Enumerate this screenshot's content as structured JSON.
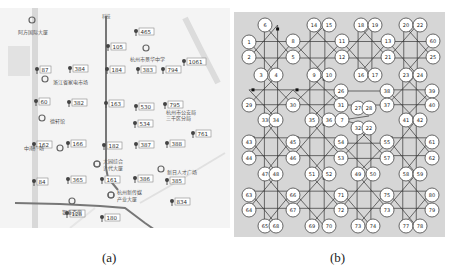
{
  "captions": {
    "a": "(a)",
    "b": "(b)"
  },
  "map": {
    "roads": [
      {
        "name": "vertical-road-left",
        "pts": [
          [
            35,
            0
          ],
          [
            35,
            220
          ]
        ],
        "w": 6,
        "c": "#d8d8d8"
      },
      {
        "name": "vertical-road-center",
        "pts": [
          [
            106,
            8
          ],
          [
            106,
            160
          ],
          [
            108,
            170
          ],
          [
            118,
            182
          ]
        ],
        "w": 2,
        "c": "#777"
      },
      {
        "name": "horizontal-road-bottom",
        "pts": [
          [
            15,
            195
          ],
          [
            60,
            196
          ],
          [
            100,
            198
          ],
          [
            125,
            200
          ],
          [
            145,
            215
          ],
          [
            155,
            222
          ]
        ],
        "w": 2,
        "c": "#777"
      },
      {
        "name": "diagonal-road-right",
        "pts": [
          [
            185,
            10
          ],
          [
            200,
            40
          ],
          [
            218,
            75
          ]
        ],
        "w": 6,
        "c": "#dcdcdc"
      },
      {
        "name": "diagonal-road-lower",
        "pts": [
          [
            140,
            195
          ],
          [
            175,
            175
          ],
          [
            225,
            145
          ]
        ],
        "w": 2,
        "c": "#e0e0e0"
      },
      {
        "name": "diagonal-road-lower2",
        "pts": [
          [
            70,
            220
          ],
          [
            95,
            200
          ]
        ],
        "w": 2,
        "c": "#e6e6e6"
      }
    ],
    "markers": [
      {
        "x": 136,
        "y": 23,
        "label": "465"
      },
      {
        "x": 108,
        "y": 38,
        "label": "105"
      },
      {
        "x": 184,
        "y": 53,
        "label": "1061"
      },
      {
        "x": 37,
        "y": 61,
        "label": "87"
      },
      {
        "x": 70,
        "y": 60,
        "label": "384"
      },
      {
        "x": 107,
        "y": 61,
        "label": "184"
      },
      {
        "x": 138,
        "y": 61,
        "label": "383"
      },
      {
        "x": 163,
        "y": 61,
        "label": "794"
      },
      {
        "x": 36,
        "y": 93,
        "label": "60"
      },
      {
        "x": 69,
        "y": 94,
        "label": "382"
      },
      {
        "x": 106,
        "y": 95,
        "label": "163"
      },
      {
        "x": 136,
        "y": 98,
        "label": "530"
      },
      {
        "x": 165,
        "y": 96,
        "label": "795"
      },
      {
        "x": 135,
        "y": 115,
        "label": "534"
      },
      {
        "x": 193,
        "y": 125,
        "label": "761"
      },
      {
        "x": 34,
        "y": 136,
        "label": "162"
      },
      {
        "x": 68,
        "y": 135,
        "label": "166"
      },
      {
        "x": 104,
        "y": 137,
        "label": "182"
      },
      {
        "x": 136,
        "y": 136,
        "label": "387"
      },
      {
        "x": 167,
        "y": 135,
        "label": "388"
      },
      {
        "x": 34,
        "y": 173,
        "label": "84"
      },
      {
        "x": 68,
        "y": 171,
        "label": "365"
      },
      {
        "x": 102,
        "y": 171,
        "label": "161"
      },
      {
        "x": 135,
        "y": 170,
        "label": "386"
      },
      {
        "x": 167,
        "y": 172,
        "label": "385"
      },
      {
        "x": 172,
        "y": 193,
        "label": "834"
      },
      {
        "x": 67,
        "y": 205,
        "label": "128"
      },
      {
        "x": 102,
        "y": 209,
        "label": "180"
      }
    ],
    "pois": [
      {
        "x": 32,
        "y": 12,
        "label": "阿方国际大厦",
        "dx": -14,
        "dy": 12
      },
      {
        "x": 45,
        "y": 71,
        "label": "浙江省家电市场",
        "dx": 8,
        "dy": 3
      },
      {
        "x": 146,
        "y": 40,
        "label": "杭州市景华中学",
        "dx": -16,
        "dy": 11
      },
      {
        "x": 42,
        "y": 110,
        "label": "德轩馆",
        "dx": 8,
        "dy": 3
      },
      {
        "x": 166,
        "y": 104,
        "label": "杭州市公安局",
        "dx": 0,
        "dy": 0
      },
      {
        "x": 166,
        "y": 110,
        "label": "三千区分局",
        "dx": 0,
        "dy": 0
      },
      {
        "x": 97,
        "y": 156,
        "label": "大园综合",
        "dx": 6,
        "dy": -3
      },
      {
        "x": 97,
        "y": 156,
        "label": "计代大厦",
        "dx": 6,
        "dy": 4
      },
      {
        "x": 161,
        "y": 161,
        "label": "新日人才广场",
        "dx": 6,
        "dy": 3
      },
      {
        "x": 111,
        "y": 187,
        "label": "杭州新传媒",
        "dx": 6,
        "dy": -3
      },
      {
        "x": 111,
        "y": 187,
        "label": "产业大厦",
        "dx": 6,
        "dy": 4
      },
      {
        "x": 72,
        "y": 193,
        "label": "银泰百货",
        "dx": -10,
        "dy": 11
      },
      {
        "x": 60,
        "y": 140,
        "label": "中南广场",
        "dx": -36,
        "dy": 0
      }
    ],
    "road_labels": [
      {
        "x": 106,
        "y": 10,
        "label": "科技"
      },
      {
        "x": 198,
        "y": 228,
        "label": "汉德路"
      },
      {
        "x": 60,
        "y": 225,
        "label": "汉德广场"
      }
    ]
  },
  "graph": {
    "node_radius": 7,
    "nodes": [
      {
        "id": "1",
        "x": 15,
        "y": 30
      },
      {
        "id": "2",
        "x": 15,
        "y": 45
      },
      {
        "id": "6",
        "x": 31,
        "y": 13
      },
      {
        "id": "8",
        "x": 59,
        "y": 29
      },
      {
        "id": "5",
        "x": 59,
        "y": 45
      },
      {
        "id": "3",
        "x": 27,
        "y": 63
      },
      {
        "id": "4",
        "x": 42,
        "y": 63
      },
      {
        "id": "14",
        "x": 80,
        "y": 13
      },
      {
        "id": "15",
        "x": 95,
        "y": 13
      },
      {
        "id": "9",
        "x": 80,
        "y": 63
      },
      {
        "id": "10",
        "x": 95,
        "y": 63
      },
      {
        "id": "11",
        "x": 108,
        "y": 29
      },
      {
        "id": "12",
        "x": 108,
        "y": 45
      },
      {
        "id": "18",
        "x": 127,
        "y": 13
      },
      {
        "id": "19",
        "x": 141,
        "y": 13
      },
      {
        "id": "16",
        "x": 127,
        "y": 63
      },
      {
        "id": "17",
        "x": 141,
        "y": 63
      },
      {
        "id": "13",
        "x": 154,
        "y": 29
      },
      {
        "id": "21",
        "x": 154,
        "y": 45
      },
      {
        "id": "20",
        "x": 172,
        "y": 13
      },
      {
        "id": "22",
        "x": 186,
        "y": 13
      },
      {
        "id": "23",
        "x": 172,
        "y": 63
      },
      {
        "id": "24",
        "x": 186,
        "y": 63
      },
      {
        "id": "60",
        "x": 199,
        "y": 29
      },
      {
        "id": "25",
        "x": 199,
        "y": 45
      },
      {
        "id": "29",
        "x": 15,
        "y": 93
      },
      {
        "id": "30",
        "x": 59,
        "y": 93
      },
      {
        "id": "26",
        "x": 107,
        "y": 79
      },
      {
        "id": "31",
        "x": 107,
        "y": 93
      },
      {
        "id": "33",
        "x": 31,
        "y": 108
      },
      {
        "id": "34",
        "x": 42,
        "y": 108
      },
      {
        "id": "35",
        "x": 78,
        "y": 108
      },
      {
        "id": "36",
        "x": 95,
        "y": 108
      },
      {
        "id": "7",
        "x": 108,
        "y": 108
      },
      {
        "id": "27",
        "x": 124,
        "y": 96
      },
      {
        "id": "28",
        "x": 135,
        "y": 96
      },
      {
        "id": "32",
        "x": 124,
        "y": 116
      },
      {
        "id": "22b",
        "x": 135,
        "y": 116
      },
      {
        "id": "38",
        "x": 153,
        "y": 79
      },
      {
        "id": "39",
        "x": 198,
        "y": 79
      },
      {
        "id": "37",
        "x": 153,
        "y": 93
      },
      {
        "id": "40",
        "x": 198,
        "y": 93
      },
      {
        "id": "41",
        "x": 172,
        "y": 108
      },
      {
        "id": "42",
        "x": 186,
        "y": 108
      },
      {
        "id": "43",
        "x": 15,
        "y": 130
      },
      {
        "id": "44",
        "x": 15,
        "y": 146
      },
      {
        "id": "45",
        "x": 59,
        "y": 130
      },
      {
        "id": "46",
        "x": 59,
        "y": 146
      },
      {
        "id": "54",
        "x": 107,
        "y": 130
      },
      {
        "id": "53",
        "x": 107,
        "y": 146
      },
      {
        "id": "55",
        "x": 153,
        "y": 130
      },
      {
        "id": "57",
        "x": 153,
        "y": 146
      },
      {
        "id": "61",
        "x": 198,
        "y": 130
      },
      {
        "id": "62",
        "x": 198,
        "y": 146
      },
      {
        "id": "47",
        "x": 31,
        "y": 162
      },
      {
        "id": "48",
        "x": 42,
        "y": 162
      },
      {
        "id": "51",
        "x": 78,
        "y": 162
      },
      {
        "id": "52",
        "x": 95,
        "y": 162
      },
      {
        "id": "49",
        "x": 124,
        "y": 162
      },
      {
        "id": "50",
        "x": 139,
        "y": 162
      },
      {
        "id": "58",
        "x": 172,
        "y": 162
      },
      {
        "id": "59",
        "x": 186,
        "y": 162
      },
      {
        "id": "63",
        "x": 15,
        "y": 183
      },
      {
        "id": "64",
        "x": 15,
        "y": 198
      },
      {
        "id": "66",
        "x": 59,
        "y": 183
      },
      {
        "id": "67",
        "x": 59,
        "y": 198
      },
      {
        "id": "71",
        "x": 107,
        "y": 183
      },
      {
        "id": "72",
        "x": 107,
        "y": 198
      },
      {
        "id": "75",
        "x": 153,
        "y": 183
      },
      {
        "id": "73",
        "x": 153,
        "y": 198
      },
      {
        "id": "80",
        "x": 198,
        "y": 183
      },
      {
        "id": "79",
        "x": 198,
        "y": 198
      },
      {
        "id": "65",
        "x": 31,
        "y": 214
      },
      {
        "id": "68",
        "x": 42,
        "y": 214
      },
      {
        "id": "69",
        "x": 78,
        "y": 214
      },
      {
        "id": "70",
        "x": 95,
        "y": 214
      },
      {
        "id": "73b",
        "x": 124,
        "y": 214
      },
      {
        "id": "74",
        "x": 139,
        "y": 214
      },
      {
        "id": "77",
        "x": 172,
        "y": 214
      },
      {
        "id": "78",
        "x": 186,
        "y": 214
      }
    ],
    "cluster_frames": [
      {
        "x0": 15,
        "y0": 13,
        "x1": 59,
        "y1": 63
      },
      {
        "x0": 59,
        "y0": 13,
        "x1": 108,
        "y1": 63
      },
      {
        "x0": 108,
        "y0": 13,
        "x1": 154,
        "y1": 63
      },
      {
        "x0": 154,
        "y0": 13,
        "x1": 199,
        "y1": 63
      },
      {
        "x0": 15,
        "y0": 63,
        "x1": 59,
        "y1": 108
      },
      {
        "x0": 59,
        "y0": 63,
        "x1": 107,
        "y1": 108
      },
      {
        "x0": 153,
        "y0": 63,
        "x1": 198,
        "y1": 108
      },
      {
        "x0": 15,
        "y0": 108,
        "x1": 59,
        "y1": 162
      },
      {
        "x0": 59,
        "y0": 108,
        "x1": 107,
        "y1": 162
      },
      {
        "x0": 107,
        "y0": 116,
        "x1": 153,
        "y1": 162
      },
      {
        "x0": 153,
        "y0": 108,
        "x1": 198,
        "y1": 162
      },
      {
        "x0": 15,
        "y0": 162,
        "x1": 59,
        "y1": 214
      },
      {
        "x0": 59,
        "y0": 162,
        "x1": 107,
        "y1": 214
      },
      {
        "x0": 107,
        "y0": 162,
        "x1": 153,
        "y1": 214
      },
      {
        "x0": 153,
        "y0": 162,
        "x1": 198,
        "y1": 214
      }
    ]
  }
}
